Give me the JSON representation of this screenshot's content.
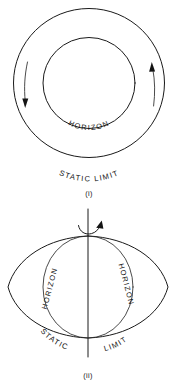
{
  "page": {
    "background_color": "#ffffff",
    "ink_color": "#141414",
    "width": 179,
    "height": 384
  },
  "figures": [
    {
      "id": "figure-i",
      "caption": "(i)",
      "view": "equatorial plane view",
      "labels": {
        "inner_boundary": "HORIZON",
        "outer_boundary": "STATIC   LIMIT"
      },
      "geometry": {
        "outer_circle": {
          "cx": 89,
          "cy": 83,
          "r": 75
        },
        "inner_circle": {
          "cx": 89,
          "cy": 83,
          "r": 46
        }
      },
      "rotation_arrows": [
        {
          "name": "left-rotation-arrow",
          "direction": "down"
        },
        {
          "name": "right-rotation-arrow",
          "direction": "up"
        }
      ]
    },
    {
      "id": "figure-ii",
      "caption": "(ii)",
      "view": "meridional cross-section",
      "labels": {
        "inner_boundary_left": "HORIZON",
        "inner_boundary_right": "HORIZON",
        "outer_boundary_left": "STATIC",
        "outer_boundary_right": "LIMIT"
      },
      "geometry": {
        "horizon_circle": {
          "cx": 88,
          "cy": 287,
          "rx": 45,
          "ry": 51
        },
        "static_limit_lens": {
          "cx": 88,
          "cy": 287,
          "half_width": 80,
          "half_height": 51
        },
        "rotation_axis": {
          "x": 88,
          "y_top": 209,
          "y_bottom": 357
        }
      },
      "rotation_arrows": [
        {
          "name": "spin-axis-arrow",
          "direction": "clockwise-about-axis"
        }
      ]
    }
  ]
}
